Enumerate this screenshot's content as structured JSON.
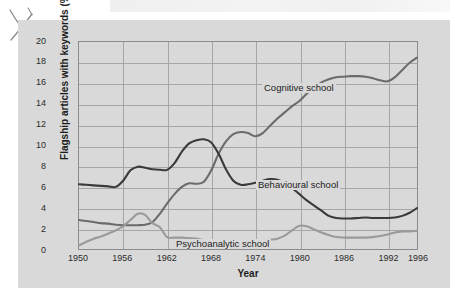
{
  "figure": {
    "background_color": "#d9d9d9",
    "page_color": "#ffffff",
    "hand_mark": "x-mark-annotation"
  },
  "chart_data": {
    "type": "line",
    "title": "",
    "xlabel": "Year",
    "ylabel": "Flagship articles with keywords (%)",
    "xlim": [
      1950,
      1996
    ],
    "ylim": [
      0,
      20
    ],
    "grid": true,
    "legend_position": "inline-annotations",
    "xticks": [
      1950,
      1956,
      1962,
      1968,
      1974,
      1980,
      1986,
      1992,
      1996
    ],
    "xtick_labels": [
      "1950",
      "1956",
      "1962",
      "1968",
      "1974",
      "1980",
      "1986",
      "1992",
      "1996"
    ],
    "yticks": [
      0,
      2,
      4,
      6,
      8,
      10,
      12,
      14,
      16,
      18,
      20
    ],
    "ytick_labels": [
      "0",
      "2",
      "4",
      "6",
      "8",
      "10",
      "12",
      "14",
      "16",
      "18",
      "20"
    ],
    "x": [
      1950,
      1951,
      1952,
      1953,
      1954,
      1955,
      1956,
      1957,
      1958,
      1959,
      1960,
      1961,
      1962,
      1963,
      1964,
      1965,
      1966,
      1967,
      1968,
      1969,
      1970,
      1971,
      1972,
      1973,
      1974,
      1975,
      1976,
      1977,
      1978,
      1979,
      1980,
      1981,
      1982,
      1983,
      1984,
      1985,
      1986,
      1987,
      1988,
      1989,
      1990,
      1991,
      1992,
      1993,
      1994,
      1995,
      1996
    ],
    "series": [
      {
        "name": "Cognitive school",
        "color": "#6b6b6b",
        "annotation": "Cognitive school",
        "values": [
          2.8,
          2.7,
          2.6,
          2.5,
          2.45,
          2.35,
          2.3,
          2.3,
          2.3,
          2.35,
          2.6,
          3.4,
          4.4,
          5.3,
          6.0,
          6.35,
          6.3,
          6.5,
          7.6,
          9.2,
          10.4,
          11.1,
          11.3,
          11.2,
          10.9,
          11.2,
          11.9,
          12.6,
          13.2,
          13.8,
          14.3,
          15.0,
          15.6,
          16.1,
          16.4,
          16.6,
          16.65,
          16.7,
          16.7,
          16.65,
          16.5,
          16.3,
          16.2,
          16.6,
          17.3,
          18.0,
          18.5
        ]
      },
      {
        "name": "Behavioural school",
        "color": "#3a3a3a",
        "annotation": "Behavioural school",
        "values": [
          6.25,
          6.2,
          6.15,
          6.1,
          6.05,
          6.0,
          6.6,
          7.6,
          7.95,
          7.85,
          7.7,
          7.65,
          7.65,
          8.3,
          9.4,
          10.2,
          10.5,
          10.6,
          10.3,
          9.2,
          7.7,
          6.6,
          6.2,
          6.25,
          6.4,
          6.6,
          6.75,
          6.7,
          6.4,
          5.9,
          5.3,
          4.7,
          4.2,
          3.7,
          3.2,
          3.0,
          2.95,
          2.95,
          3.0,
          3.05,
          3.0,
          3.0,
          3.0,
          3.05,
          3.2,
          3.5,
          3.95
        ]
      },
      {
        "name": "Psychoanalytic school",
        "color": "#9a9a9a",
        "annotation": "Psychoanalytic school",
        "values": [
          0.35,
          0.7,
          1.0,
          1.2,
          1.5,
          1.8,
          2.2,
          2.8,
          3.4,
          3.3,
          2.5,
          2.1,
          1.15,
          1.1,
          1.1,
          1.05,
          1.0,
          0.85,
          0.7,
          0.6,
          0.55,
          0.6,
          0.75,
          0.8,
          0.8,
          0.85,
          0.9,
          1.0,
          1.3,
          1.8,
          2.25,
          2.2,
          1.9,
          1.6,
          1.35,
          1.15,
          1.1,
          1.1,
          1.1,
          1.1,
          1.15,
          1.25,
          1.4,
          1.6,
          1.7,
          1.7,
          1.75
        ]
      }
    ]
  }
}
